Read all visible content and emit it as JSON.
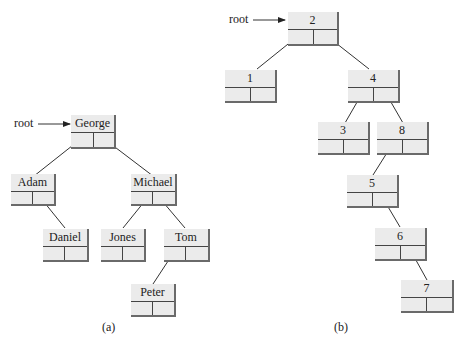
{
  "diagram_a": {
    "caption": "(a)",
    "root_label": "root",
    "nodes": {
      "george": "George",
      "adam": "Adam",
      "michael": "Michael",
      "daniel": "Daniel",
      "jones": "Jones",
      "tom": "Tom",
      "peter": "Peter"
    }
  },
  "diagram_b": {
    "caption": "(b)",
    "root_label": "root",
    "nodes": {
      "n2": "2",
      "n1": "1",
      "n4": "4",
      "n3": "3",
      "n8": "8",
      "n5": "5",
      "n6": "6",
      "n7": "7"
    }
  },
  "colors": {
    "node_fill": "#ebebeb",
    "node_shadow": "#6a6a6a",
    "line": "#333333"
  }
}
